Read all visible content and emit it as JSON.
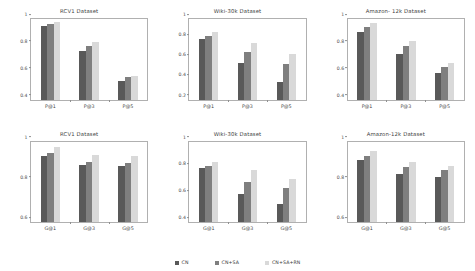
{
  "figure": {
    "width": 475,
    "height": 271,
    "background": "#ffffff"
  },
  "series_colors": {
    "CN": "#595959",
    "CN+SA": "#7f7f7f",
    "CN+SA+RN": "#d9d9d9"
  },
  "legend": {
    "position": "bottom-center",
    "items": [
      {
        "label": "CN",
        "color": "#595959"
      },
      {
        "label": "CN+SA",
        "color": "#7f7f7f"
      },
      {
        "label": "CN+SA+RN",
        "color": "#d9d9d9"
      }
    ]
  },
  "chart_data": [
    {
      "type": "bar",
      "title": "RCV1 Dataset",
      "xlabel": "",
      "ylabel": "",
      "categories": [
        "P@1",
        "P@3",
        "P@5"
      ],
      "ylim": [
        0.4,
        1.0
      ],
      "yticks": [
        "0.4",
        "0.6",
        "0.8",
        "1"
      ],
      "ytickvalues": [
        0.4,
        0.6,
        0.8,
        1.0
      ],
      "grid": false,
      "series": [
        {
          "name": "CN",
          "values": [
            0.947,
            0.759,
            0.54
          ]
        },
        {
          "name": "CN+SA",
          "values": [
            0.964,
            0.802,
            0.567
          ]
        },
        {
          "name": "CN+SA+RN",
          "values": [
            0.976,
            0.827,
            0.576
          ]
        }
      ]
    },
    {
      "type": "bar",
      "title": "Wiki-30k Dataset",
      "xlabel": "",
      "ylabel": "",
      "categories": [
        "P@1",
        "P@3",
        "P@5"
      ],
      "ylim": [
        0.2,
        1.0
      ],
      "yticks": [
        "0.2",
        "0.4",
        "0.6",
        "0.8",
        "1"
      ],
      "ytickvalues": [
        0.2,
        0.4,
        0.6,
        0.8,
        1.0
      ],
      "grid": false,
      "series": [
        {
          "name": "CN",
          "values": [
            0.8,
            0.558,
            0.375
          ]
        },
        {
          "name": "CN+SA",
          "values": [
            0.828,
            0.675,
            0.55
          ]
        },
        {
          "name": "CN+SA+RN",
          "values": [
            0.868,
            0.76,
            0.65
          ]
        }
      ]
    },
    {
      "type": "bar",
      "title": "Amazon- 12k Dataset",
      "xlabel": "",
      "ylabel": "",
      "categories": [
        "P@1",
        "P@3",
        "P@5"
      ],
      "ylim": [
        0.4,
        1.0
      ],
      "yticks": [
        "0.4",
        "0.6",
        "0.8",
        "1"
      ],
      "ytickvalues": [
        0.4,
        0.6,
        0.8,
        1.0
      ],
      "grid": false,
      "series": [
        {
          "name": "CN",
          "values": [
            0.9,
            0.742,
            0.597
          ]
        },
        {
          "name": "CN+SA",
          "values": [
            0.938,
            0.8,
            0.641
          ]
        },
        {
          "name": "CN+SA+RN",
          "values": [
            0.97,
            0.833,
            0.675
          ]
        }
      ]
    },
    {
      "type": "bar",
      "title": "RCV1 Dataset",
      "xlabel": "",
      "ylabel": "",
      "categories": [
        "G@1",
        "G@3",
        "G@5"
      ],
      "ylim": [
        0.6,
        1.0
      ],
      "yticks": [
        "0.6",
        "0.8",
        "1"
      ],
      "ytickvalues": [
        0.6,
        0.8,
        1.0
      ],
      "grid": false,
      "series": [
        {
          "name": "CN",
          "values": [
            0.93,
            0.884,
            0.88
          ]
        },
        {
          "name": "CN+SA",
          "values": [
            0.941,
            0.898,
            0.891
          ]
        },
        {
          "name": "CN+SA+RN",
          "values": [
            0.974,
            0.933,
            0.928
          ]
        }
      ]
    },
    {
      "type": "bar",
      "title": "Wiki-30k Dataset",
      "xlabel": "",
      "ylabel": "",
      "categories": [
        "G@1",
        "G@3",
        "G@5"
      ],
      "ylim": [
        0.4,
        1.0
      ],
      "yticks": [
        "0.4",
        "0.6",
        "0.8",
        "1"
      ],
      "ytickvalues": [
        0.4,
        0.6,
        0.8,
        1.0
      ],
      "grid": false,
      "series": [
        {
          "name": "CN",
          "values": [
            0.8,
            0.61,
            0.535
          ]
        },
        {
          "name": "CN+SA",
          "values": [
            0.818,
            0.7,
            0.655
          ]
        },
        {
          "name": "CN+SA+RN",
          "values": [
            0.85,
            0.785,
            0.718
          ]
        }
      ]
    },
    {
      "type": "bar",
      "title": "Amazon-12k Dataset",
      "xlabel": "",
      "ylabel": "",
      "categories": [
        "G@1",
        "G@3",
        "G@5"
      ],
      "ylim": [
        0.6,
        1.0
      ],
      "yticks": [
        "0.6",
        "0.8",
        "1"
      ],
      "ytickvalues": [
        0.6,
        0.8,
        1.0
      ],
      "grid": false,
      "series": [
        {
          "name": "CN",
          "values": [
            0.91,
            0.838,
            0.822
          ]
        },
        {
          "name": "CN+SA",
          "values": [
            0.928,
            0.872,
            0.857
          ]
        },
        {
          "name": "CN+SA+RN",
          "values": [
            0.955,
            0.898,
            0.877
          ]
        }
      ]
    }
  ]
}
